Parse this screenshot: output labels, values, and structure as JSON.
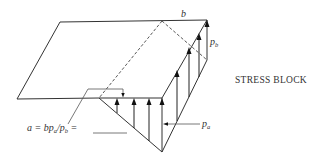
{
  "figure": {
    "title": "STRESS BLOCK",
    "labels": {
      "width": "b",
      "max_pressure": "p",
      "max_pressure_sub": "b",
      "min_pressure": "p",
      "min_pressure_sub": "a",
      "formula_lhs": "a = bp",
      "formula_sub1": "a",
      "formula_mid": "/p",
      "formula_sub2": "b",
      "formula_rhs": " ="
    },
    "colors": {
      "line": "#333333",
      "background": "#ffffff"
    }
  }
}
